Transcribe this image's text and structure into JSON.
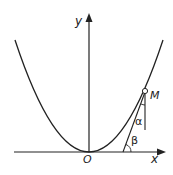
{
  "diagram": {
    "type": "parabola-tangent",
    "labels": {
      "x_axis": "x",
      "y_axis": "y",
      "origin": "O",
      "point": "M",
      "angle_alpha": "α",
      "angle_beta": "β"
    },
    "colors": {
      "stroke": "#222222",
      "background": "#ffffff"
    }
  }
}
